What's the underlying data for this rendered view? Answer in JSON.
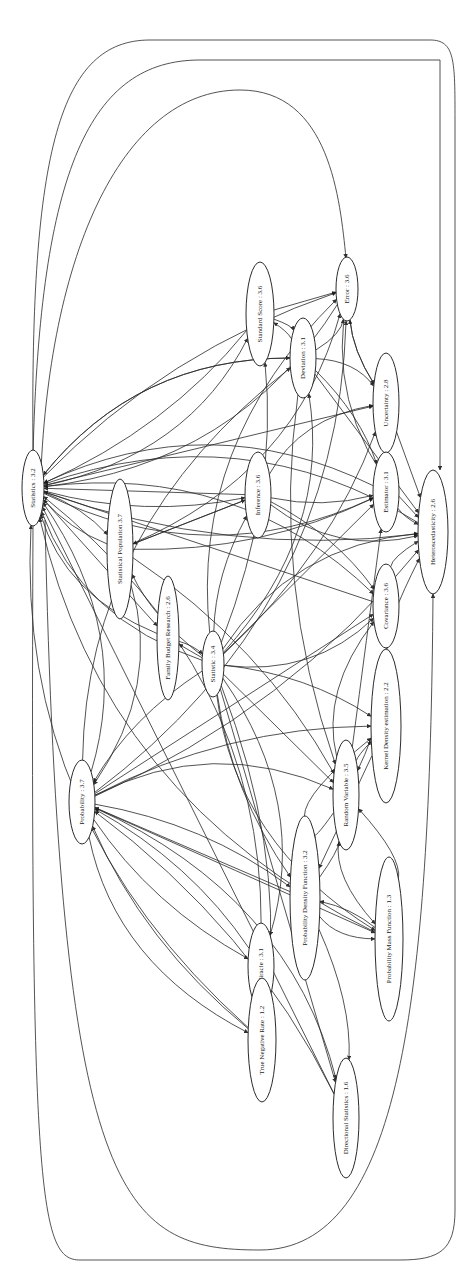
{
  "diagram": {
    "type": "directed-graph",
    "orientation": "rotated-90-ccw",
    "colors": {
      "background": "#ffffff",
      "stroke": "#2b2b2b",
      "text": "#222222"
    },
    "nodes": [
      {
        "id": "statistics",
        "label": "Statistics : 3.2",
        "cx": 33,
        "cy": 488,
        "rx": 11,
        "ry": 38
      },
      {
        "id": "statistical_population",
        "label": "Statistical Population 3.7",
        "cx": 120,
        "cy": 549,
        "rx": 13,
        "ry": 70
      },
      {
        "id": "family_budget_research",
        "label": "Family Budget Research : 2.6",
        "cx": 168,
        "cy": 638,
        "rx": 11,
        "ry": 62
      },
      {
        "id": "statistic",
        "label": "Statistic : 3.4",
        "cx": 213,
        "cy": 664,
        "rx": 11,
        "ry": 33
      },
      {
        "id": "probability",
        "label": "Probability : 3.7",
        "cx": 82,
        "cy": 802,
        "rx": 13,
        "ry": 42
      },
      {
        "id": "standard_score",
        "label": "Standard Score : 3.6",
        "cx": 260,
        "cy": 314,
        "rx": 14,
        "ry": 52
      },
      {
        "id": "deviation",
        "label": "Deviation : 3.1",
        "cx": 303,
        "cy": 358,
        "rx": 13,
        "ry": 40
      },
      {
        "id": "error",
        "label": "Error : 3.6",
        "cx": 347,
        "cy": 289,
        "rx": 11,
        "ry": 32
      },
      {
        "id": "uncertainty",
        "label": "Uncertainty : 2.8",
        "cx": 386,
        "cy": 403,
        "rx": 13,
        "ry": 50
      },
      {
        "id": "inference",
        "label": "Inference : 3.6",
        "cx": 258,
        "cy": 495,
        "rx": 13,
        "ry": 43
      },
      {
        "id": "estimator",
        "label": "Estimator : 3.1",
        "cx": 386,
        "cy": 492,
        "rx": 13,
        "ry": 40
      },
      {
        "id": "heteroscedasticity",
        "label": "Heteroscedasticity : 2.6",
        "cx": 433,
        "cy": 532,
        "rx": 15,
        "ry": 62
      },
      {
        "id": "covariance",
        "label": "Covariance : 3.6",
        "cx": 386,
        "cy": 606,
        "rx": 13,
        "ry": 42
      },
      {
        "id": "kernel_density_estimation",
        "label": "Kernel Density estimation : 2.2",
        "cx": 386,
        "cy": 726,
        "rx": 15,
        "ry": 77
      },
      {
        "id": "random_variable",
        "label": "Random Variable : 3.5",
        "cx": 346,
        "cy": 795,
        "rx": 13,
        "ry": 55
      },
      {
        "id": "probability_density_function",
        "label": "Probability Density Function : 3.2",
        "cx": 305,
        "cy": 898,
        "rx": 15,
        "ry": 82
      },
      {
        "id": "probability_mass_function",
        "label": "Probability Mass Function : 1.3",
        "cx": 389,
        "cy": 939,
        "rx": 14,
        "ry": 82
      },
      {
        "id": "miracle",
        "label": "Miracle : 3.1",
        "cx": 261,
        "cy": 966,
        "rx": 13,
        "ry": 43
      },
      {
        "id": "true_negative_rate",
        "label": "True Negative Rate : 1.2",
        "cx": 262,
        "cy": 1040,
        "rx": 14,
        "ry": 62
      },
      {
        "id": "directional_statistics",
        "label": "Directional Statistics : 1.6",
        "cx": 346,
        "cy": 1118,
        "rx": 13,
        "ry": 60
      }
    ],
    "edges": [
      [
        "statistic",
        "statistics"
      ],
      [
        "statistic",
        "statistical_population"
      ],
      [
        "statistic",
        "family_budget_research"
      ],
      [
        "statistic",
        "standard_score"
      ],
      [
        "statistic",
        "deviation"
      ],
      [
        "statistic",
        "error"
      ],
      [
        "statistic",
        "inference"
      ],
      [
        "statistic",
        "estimator"
      ],
      [
        "statistic",
        "uncertainty"
      ],
      [
        "statistic",
        "covariance"
      ],
      [
        "statistic",
        "heteroscedasticity"
      ],
      [
        "statistic",
        "kernel_density_estimation"
      ],
      [
        "statistic",
        "random_variable"
      ],
      [
        "statistic",
        "probability_density_function"
      ],
      [
        "statistic",
        "probability_mass_function"
      ],
      [
        "statistic",
        "miracle"
      ],
      [
        "statistic",
        "true_negative_rate"
      ],
      [
        "statistic",
        "directional_statistics"
      ],
      [
        "statistic",
        "probability"
      ],
      [
        "statistics",
        "standard_score"
      ],
      [
        "statistics",
        "deviation"
      ],
      [
        "statistics",
        "error"
      ],
      [
        "statistics",
        "uncertainty"
      ],
      [
        "statistics",
        "heteroscedasticity"
      ],
      [
        "statistics",
        "estimator"
      ],
      [
        "statistics",
        "covariance"
      ],
      [
        "statistics",
        "statistical_population"
      ],
      [
        "statistics",
        "family_budget_research"
      ],
      [
        "statistics",
        "inference"
      ],
      [
        "probability",
        "statistics"
      ],
      [
        "probability",
        "random_variable"
      ],
      [
        "probability",
        "probability_density_function"
      ],
      [
        "probability",
        "probability_mass_function"
      ],
      [
        "probability",
        "miracle"
      ],
      [
        "probability",
        "true_negative_rate"
      ],
      [
        "probability",
        "directional_statistics"
      ],
      [
        "probability",
        "kernel_density_estimation"
      ],
      [
        "probability",
        "covariance"
      ],
      [
        "probability",
        "heteroscedasticity"
      ],
      [
        "probability",
        "error"
      ],
      [
        "probability",
        "deviation"
      ],
      [
        "statistical_population",
        "statistics"
      ],
      [
        "statistical_population",
        "inference"
      ],
      [
        "statistical_population",
        "estimator"
      ],
      [
        "statistical_population",
        "error"
      ],
      [
        "statistical_population",
        "probability"
      ],
      [
        "statistical_population",
        "random_variable"
      ],
      [
        "inference",
        "statistics"
      ],
      [
        "inference",
        "estimator"
      ],
      [
        "inference",
        "heteroscedasticity"
      ],
      [
        "inference",
        "uncertainty"
      ],
      [
        "inference",
        "covariance"
      ],
      [
        "inference",
        "statistical_population"
      ],
      [
        "deviation",
        "standard_score"
      ],
      [
        "deviation",
        "error"
      ],
      [
        "deviation",
        "uncertainty"
      ],
      [
        "deviation",
        "estimator"
      ],
      [
        "deviation",
        "heteroscedasticity"
      ],
      [
        "deviation",
        "random_variable"
      ],
      [
        "deviation",
        "statistics"
      ],
      [
        "standard_score",
        "deviation"
      ],
      [
        "standard_score",
        "statistics"
      ],
      [
        "standard_score",
        "error"
      ],
      [
        "error",
        "uncertainty"
      ],
      [
        "error",
        "heteroscedasticity"
      ],
      [
        "error",
        "statistics"
      ],
      [
        "uncertainty",
        "error"
      ],
      [
        "uncertainty",
        "heteroscedasticity"
      ],
      [
        "estimator",
        "heteroscedasticity"
      ],
      [
        "estimator",
        "statistics"
      ],
      [
        "covariance",
        "heteroscedasticity"
      ],
      [
        "covariance",
        "random_variable"
      ],
      [
        "covariance",
        "statistics"
      ],
      [
        "random_variable",
        "probability_density_function"
      ],
      [
        "random_variable",
        "probability_mass_function"
      ],
      [
        "random_variable",
        "covariance"
      ],
      [
        "random_variable",
        "kernel_density_estimation"
      ],
      [
        "random_variable",
        "estimator"
      ],
      [
        "probability_density_function",
        "random_variable"
      ],
      [
        "probability_density_function",
        "probability_mass_function"
      ],
      [
        "probability_density_function",
        "kernel_density_estimation"
      ],
      [
        "probability_density_function",
        "directional_statistics"
      ],
      [
        "probability_density_function",
        "probability"
      ],
      [
        "probability_mass_function",
        "probability_density_function"
      ],
      [
        "probability_mass_function",
        "random_variable"
      ],
      [
        "probability_mass_function",
        "statistics"
      ],
      [
        "kernel_density_estimation",
        "heteroscedasticity"
      ],
      [
        "kernel_density_estimation",
        "probability_density_function"
      ],
      [
        "miracle",
        "probability"
      ],
      [
        "miracle",
        "statistics"
      ],
      [
        "true_negative_rate",
        "statistics"
      ],
      [
        "true_negative_rate",
        "probability"
      ],
      [
        "directional_statistics",
        "statistics"
      ],
      [
        "directional_statistics",
        "probability"
      ],
      [
        "heteroscedasticity",
        "statistics"
      ],
      [
        "family_budget_research",
        "statistics"
      ],
      [
        "family_budget_research",
        "statistic"
      ]
    ]
  }
}
